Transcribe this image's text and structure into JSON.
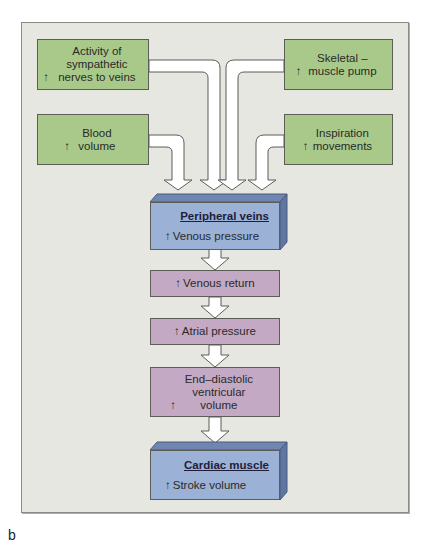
{
  "diagram": {
    "colors": {
      "panel_bg": "#e7e7e1",
      "input_box": "#a9c98a",
      "intermediate_box": "#c4a9c4",
      "organ_box": "#9bb1d6",
      "arrow_fill": "#ffffff",
      "outline": "#5d5d58"
    },
    "up_arrow_symbol": "↑",
    "inputs": [
      {
        "id": "sympathetic",
        "label": "Activity of sympathetic nerves to veins"
      },
      {
        "id": "blood-volume",
        "label": "Blood volume"
      },
      {
        "id": "skeletal-pump",
        "label": "Skeletal – muscle pump"
      },
      {
        "id": "inspiration",
        "label": "Inspiration movements"
      }
    ],
    "peripheral_veins": {
      "title": "Peripheral veins",
      "effect": "Venous pressure"
    },
    "chain": [
      {
        "id": "venous-return",
        "label": "Venous return"
      },
      {
        "id": "atrial-pressure",
        "label": "Atrial pressure"
      },
      {
        "id": "edv",
        "label": "End–diastolic ventricular volume"
      }
    ],
    "cardiac_muscle": {
      "title": "Cardiac muscle",
      "effect": "Stroke volume"
    },
    "panel_label": "b"
  }
}
